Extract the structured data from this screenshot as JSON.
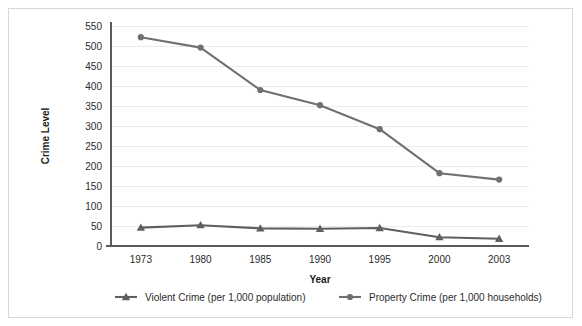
{
  "chart_data": {
    "type": "line",
    "title": "",
    "xlabel": "Year",
    "ylabel": "Crime Level",
    "categories": [
      "1973",
      "1980",
      "1985",
      "1990",
      "1995",
      "2000",
      "2003"
    ],
    "ylim": [
      0,
      550
    ],
    "ytick_step": 50,
    "yticks": [
      "0",
      "50",
      "100",
      "150",
      "200",
      "250",
      "300",
      "350",
      "400",
      "450",
      "500",
      "550"
    ],
    "grid": true,
    "legend_position": "bottom",
    "series": [
      {
        "name": "Violent Crime (per 1,000 population)",
        "marker": "triangle",
        "color": "#5f5f5f",
        "values": [
          46,
          52,
          44,
          43,
          45,
          22,
          18
        ]
      },
      {
        "name": "Property Crime (per 1,000 households)",
        "marker": "circle",
        "color": "#707070",
        "values": [
          522,
          496,
          390,
          352,
          292,
          182,
          166
        ]
      }
    ]
  },
  "figure": {
    "border_color": "#d8d8d8",
    "background": "#ffffff",
    "gridline_color": "#ececec",
    "axis_color": "#5a5a5a",
    "text_color": "#2b2b2b"
  }
}
